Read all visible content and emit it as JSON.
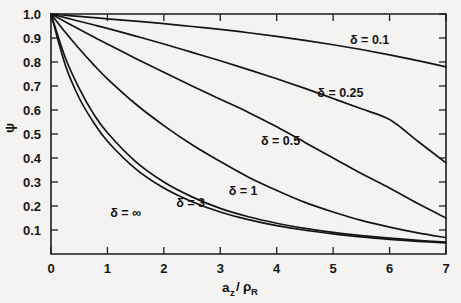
{
  "chart_data": {
    "type": "line",
    "title": "",
    "xlabel": "a_z/ρ_R",
    "ylabel": "ψ",
    "xlim": [
      0,
      7
    ],
    "ylim": [
      0,
      1.0
    ],
    "grid": false,
    "legend_position": "inline-curve-labels",
    "x_ticks": [
      "0",
      "1",
      "2",
      "3",
      "4",
      "5",
      "6",
      "7"
    ],
    "x_tick_values": [
      0,
      1,
      2,
      3,
      4,
      5,
      6,
      7
    ],
    "y_ticks": [
      "0.1",
      "0.2",
      "0.3",
      "0.4",
      "0.5",
      "0.6",
      "0.7",
      "0.8",
      "0.9",
      "1.0"
    ],
    "y_tick_values": [
      0.1,
      0.2,
      0.3,
      0.4,
      0.5,
      0.6,
      0.7,
      0.8,
      0.9,
      1.0
    ],
    "x": [
      0,
      0.25,
      0.5,
      0.75,
      1,
      1.5,
      2,
      2.5,
      3,
      3.5,
      4,
      4.5,
      5,
      5.5,
      6,
      6.5,
      7
    ],
    "series": [
      {
        "name": "δ = 0.1",
        "label": "δ = 0.1",
        "label_x": 5.3,
        "label_y": 0.875,
        "values": [
          1.0,
          0.995,
          0.99,
          0.985,
          0.98,
          0.97,
          0.96,
          0.948,
          0.936,
          0.922,
          0.907,
          0.89,
          0.872,
          0.852,
          0.83,
          0.806,
          0.78
        ]
      },
      {
        "name": "δ = 0.25",
        "label": "δ = 0.25",
        "label_x": 4.72,
        "label_y": 0.655,
        "values": [
          1.0,
          0.985,
          0.97,
          0.955,
          0.94,
          0.908,
          0.875,
          0.84,
          0.805,
          0.768,
          0.73,
          0.69,
          0.648,
          0.605,
          0.56,
          0.47,
          0.38
        ]
      },
      {
        "name": "δ = 0.5",
        "label": "δ = 0.5",
        "label_x": 3.72,
        "label_y": 0.455,
        "values": [
          1.0,
          0.968,
          0.936,
          0.905,
          0.875,
          0.815,
          0.757,
          0.7,
          0.645,
          0.59,
          0.53,
          0.465,
          0.4,
          0.335,
          0.275,
          0.21,
          0.15
        ]
      },
      {
        "name": "δ = 1",
        "label": "δ = 1",
        "label_x": 3.15,
        "label_y": 0.245,
        "values": [
          1.0,
          0.925,
          0.855,
          0.79,
          0.73,
          0.625,
          0.535,
          0.455,
          0.385,
          0.32,
          0.265,
          0.215,
          0.175,
          0.14,
          0.112,
          0.088,
          0.068
        ]
      },
      {
        "name": "δ = 3",
        "label": "δ = 3",
        "label_x": 2.22,
        "label_y": 0.195,
        "values": [
          1.0,
          0.82,
          0.69,
          0.585,
          0.505,
          0.385,
          0.3,
          0.238,
          0.19,
          0.155,
          0.128,
          0.107,
          0.09,
          0.077,
          0.066,
          0.057,
          0.05
        ]
      },
      {
        "name": "δ = ∞",
        "label": "δ = ∞",
        "label_x": 1.05,
        "label_y": 0.155,
        "values": [
          1.0,
          0.79,
          0.65,
          0.55,
          0.47,
          0.355,
          0.275,
          0.218,
          0.175,
          0.143,
          0.118,
          0.099,
          0.084,
          0.071,
          0.061,
          0.053,
          0.046
        ]
      }
    ]
  },
  "axis": {
    "x_title_main": "a",
    "x_title_sub1": "z",
    "x_title_slash": "/",
    "x_title_rho": "ρ",
    "x_title_sub2": "R",
    "y_title": "ψ"
  }
}
